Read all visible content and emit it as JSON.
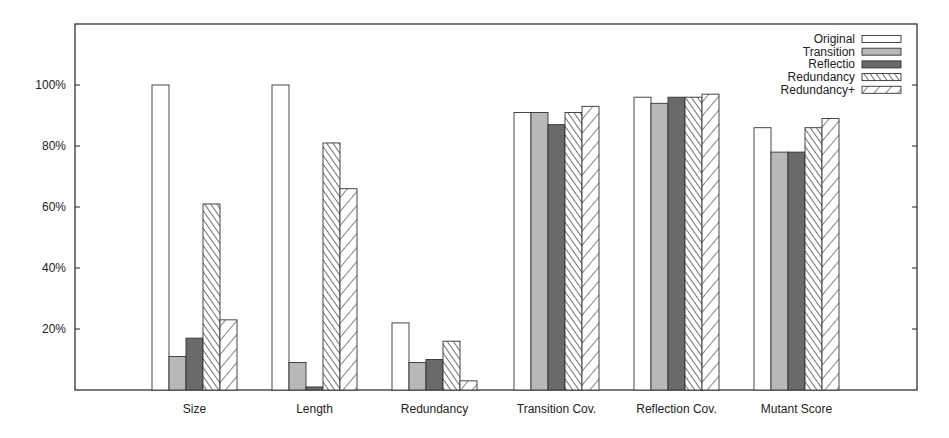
{
  "chart_data": {
    "type": "bar",
    "title": "",
    "xlabel": "",
    "ylabel": "",
    "ylim": [
      0,
      120
    ],
    "yticks": [
      "20%",
      "40%",
      "60%",
      "80%",
      "100%"
    ],
    "ytick_values": [
      20,
      40,
      60,
      80,
      100
    ],
    "grid": false,
    "legend_position": "top-right",
    "categories": [
      "Size",
      "Length",
      "Redundancy",
      "Transition Cov.",
      "Reflection Cov.",
      "Mutant Score"
    ],
    "series": [
      {
        "name": "Original",
        "pattern": "white",
        "values": [
          100,
          100,
          22,
          91,
          96,
          86
        ]
      },
      {
        "name": "Transition",
        "pattern": "light-gray",
        "values": [
          11,
          9,
          9,
          91,
          94,
          78
        ]
      },
      {
        "name": "Reflectio",
        "pattern": "dark-gray",
        "values": [
          17,
          1,
          10,
          87,
          96,
          78
        ]
      },
      {
        "name": "Redundancy",
        "pattern": "dense-backslash-hatch",
        "values": [
          61,
          81,
          16,
          91,
          96,
          86
        ]
      },
      {
        "name": "Redundancy+",
        "pattern": "sparse-slash-hatch",
        "values": [
          23,
          66,
          3,
          93,
          97,
          89
        ]
      }
    ]
  },
  "colors": {
    "axis": "#222222",
    "light_gray": "#b8b8b8",
    "dark_gray": "#6a6a6a",
    "hatch": "#333333"
  }
}
